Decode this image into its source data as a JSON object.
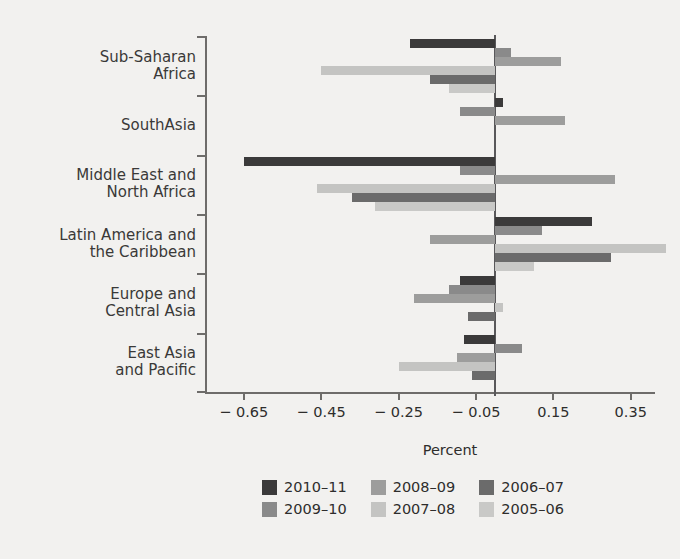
{
  "chart_data": {
    "type": "bar",
    "orientation": "horizontal",
    "title": "",
    "subtitle": "",
    "xlabel": "Percent",
    "ylabel": "",
    "xlim": [
      -0.75,
      0.41
    ],
    "xticks": [
      -0.65,
      -0.45,
      -0.25,
      -0.05,
      0.15,
      0.35
    ],
    "xtick_labels": [
      "− 0.65",
      "− 0.45",
      "− 0.25",
      "− 0.05",
      "0.15",
      "0.35"
    ],
    "grid": false,
    "legend_position": "bottom",
    "categories": [
      "Sub-Saharan Africa",
      "SouthAsia",
      "Middle East and North Africa",
      "Latin America and the Caribbean",
      "Europe and Central Asia",
      "East Asia and Pacific"
    ],
    "category_lines": [
      [
        "Sub-Saharan",
        "Africa"
      ],
      [
        "SouthAsia"
      ],
      [
        "Middle East and",
        "North Africa"
      ],
      [
        "Latin America and",
        "the Caribbean"
      ],
      [
        "Europe and",
        "Central Asia"
      ],
      [
        "East Asia",
        "and Pacific"
      ]
    ],
    "series": [
      {
        "name": "2010–11",
        "color": "#3b3a3a",
        "values": [
          -0.22,
          0.02,
          -0.65,
          0.25,
          -0.09,
          -0.08
        ]
      },
      {
        "name": "2009–10",
        "color": "#8a8a8a",
        "values": [
          0.04,
          -0.09,
          -0.09,
          0.12,
          -0.12,
          0.07
        ]
      },
      {
        "name": "2008–09",
        "color": "#9d9d9c",
        "values": [
          0.17,
          0.18,
          0.31,
          -0.17,
          -0.21,
          -0.1
        ]
      },
      {
        "name": "2007–08",
        "color": "#c4c4c2",
        "values": [
          -0.45,
          0.0,
          -0.46,
          0.44,
          0.02,
          -0.25
        ]
      },
      {
        "name": "2006–07",
        "color": "#6b6b6b",
        "values": [
          -0.17,
          0.0,
          -0.37,
          0.3,
          -0.07,
          -0.06
        ]
      },
      {
        "name": "2005–06",
        "color": "#c9c9c7",
        "values": [
          -0.12,
          0.0,
          -0.31,
          0.1,
          0.0,
          0.0
        ]
      }
    ]
  },
  "legend": {
    "entries": [
      {
        "label": "2010–11",
        "color": "#3b3a3a"
      },
      {
        "label": "2008–09",
        "color": "#9d9d9c"
      },
      {
        "label": "2006–07",
        "color": "#6b6b6b"
      },
      {
        "label": "2009–10",
        "color": "#8a8a8a"
      },
      {
        "label": "2007–08",
        "color": "#c4c4c2"
      },
      {
        "label": "2005–06",
        "color": "#c9c9c7"
      }
    ]
  },
  "axis": {
    "x_label": "Percent"
  },
  "colors": {
    "background": "#f2f1ef",
    "axis": "#6e6c6a",
    "text": "#2e2d2c"
  }
}
